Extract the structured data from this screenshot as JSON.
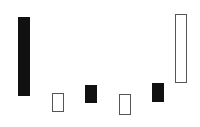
{
  "chart_data": {
    "type": "bar",
    "subtype": "floating",
    "title": "",
    "xlabel": "",
    "ylabel": "",
    "grid": false,
    "legend": null,
    "canvas_height": 127,
    "bars": [
      {
        "index": 1,
        "x": 18,
        "width": 12,
        "top": 17,
        "bottom": 96,
        "style": "filled"
      },
      {
        "index": 2,
        "x": 52,
        "width": 12,
        "top": 93,
        "bottom": 112,
        "style": "hollow"
      },
      {
        "index": 3,
        "x": 85,
        "width": 12,
        "top": 85,
        "bottom": 103,
        "style": "filled"
      },
      {
        "index": 4,
        "x": 119,
        "width": 12,
        "top": 94,
        "bottom": 115,
        "style": "hollow"
      },
      {
        "index": 5,
        "x": 152,
        "width": 12,
        "top": 83,
        "bottom": 102,
        "style": "filled"
      },
      {
        "index": 6,
        "x": 175,
        "width": 12,
        "top": 14,
        "bottom": 83,
        "style": "hollow"
      }
    ],
    "colors": {
      "filled": "#111111",
      "hollow_border": "#555555",
      "background": "#ffffff"
    }
  }
}
